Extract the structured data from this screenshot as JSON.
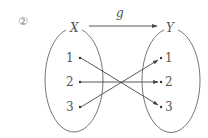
{
  "problem_number": "②",
  "function_name": "g",
  "domain_set": {
    "label": "X",
    "elements": [
      "1",
      "2",
      "3"
    ]
  },
  "codomain_set": {
    "label": "Y",
    "elements": [
      "1",
      "2",
      "3"
    ]
  },
  "mapping": [
    {
      "from": "1",
      "to": "3"
    },
    {
      "from": "2",
      "to": "2"
    },
    {
      "from": "3",
      "to": "1"
    }
  ],
  "colors": {
    "line": "#555555",
    "text": "#555555"
  }
}
